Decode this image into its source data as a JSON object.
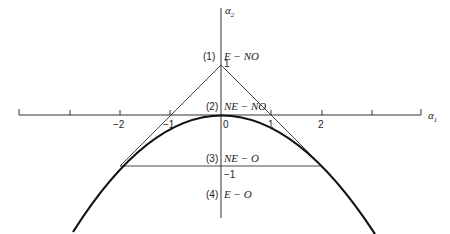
{
  "diagram": {
    "axes": {
      "x_label": "α",
      "x_sub": "1",
      "y_label": "α",
      "y_sub": "2",
      "x_ticks": [
        "−2",
        "−1",
        "0",
        "1",
        "2"
      ],
      "y_ticks": [
        "1",
        "−1"
      ]
    },
    "regions": [
      {
        "num": "(1)",
        "name": "E − NO"
      },
      {
        "num": "(2)",
        "name": "NE − NO"
      },
      {
        "num": "(3)",
        "name": "NE − O"
      },
      {
        "num": "(4)",
        "name": "E − O"
      }
    ],
    "curve": "α2 = −α1²/4",
    "tangent_apex": [
      0,
      1
    ],
    "tangent_points": [
      [
        -2,
        -1
      ],
      [
        2,
        -1
      ]
    ],
    "colors": {
      "ink": "#222222",
      "background": "#ffffff"
    }
  }
}
